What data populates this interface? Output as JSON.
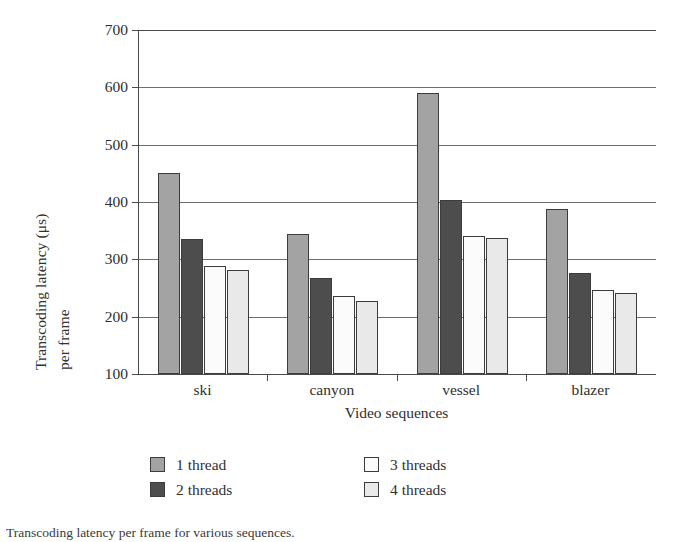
{
  "chart_data": {
    "type": "bar",
    "title": "",
    "xlabel": "Video sequences",
    "ylabel_line1": "Transcoding latency (μs)",
    "ylabel_line2": "per frame",
    "categories": [
      "ski",
      "canyon",
      "vessel",
      "blazer"
    ],
    "series": [
      {
        "name": "1 thread",
        "color": "#a3a3a3",
        "values": [
          450,
          345,
          590,
          387
        ]
      },
      {
        "name": "2 threads",
        "color": "#4d4d4d",
        "values": [
          336,
          267,
          403,
          277
        ]
      },
      {
        "name": "3 threads",
        "color": "#fbfbfb",
        "values": [
          289,
          236,
          340,
          247
        ]
      },
      {
        "name": "4 threads",
        "color": "#e9e9e9",
        "values": [
          281,
          228,
          338,
          241
        ]
      }
    ],
    "ylim": [
      100,
      700
    ],
    "yticks": [
      100,
      200,
      300,
      400,
      500,
      600,
      700
    ],
    "ytick_labels": [
      "100",
      "200",
      "300",
      "400",
      "500",
      "600",
      "700"
    ],
    "grid": "horizontal",
    "legend_position": "below-plot",
    "bar_border_color": "#3c3c3c",
    "axis_color": "#4a4a4a"
  },
  "caption": "Transcoding latency per frame for various sequences.",
  "legend": {
    "items": [
      {
        "label": "1 thread",
        "color": "#a3a3a3"
      },
      {
        "label": "3 threads",
        "color": "#fbfbfb"
      },
      {
        "label": "2 threads",
        "color": "#4d4d4d"
      },
      {
        "label": "4 threads",
        "color": "#e9e9e9"
      }
    ]
  }
}
